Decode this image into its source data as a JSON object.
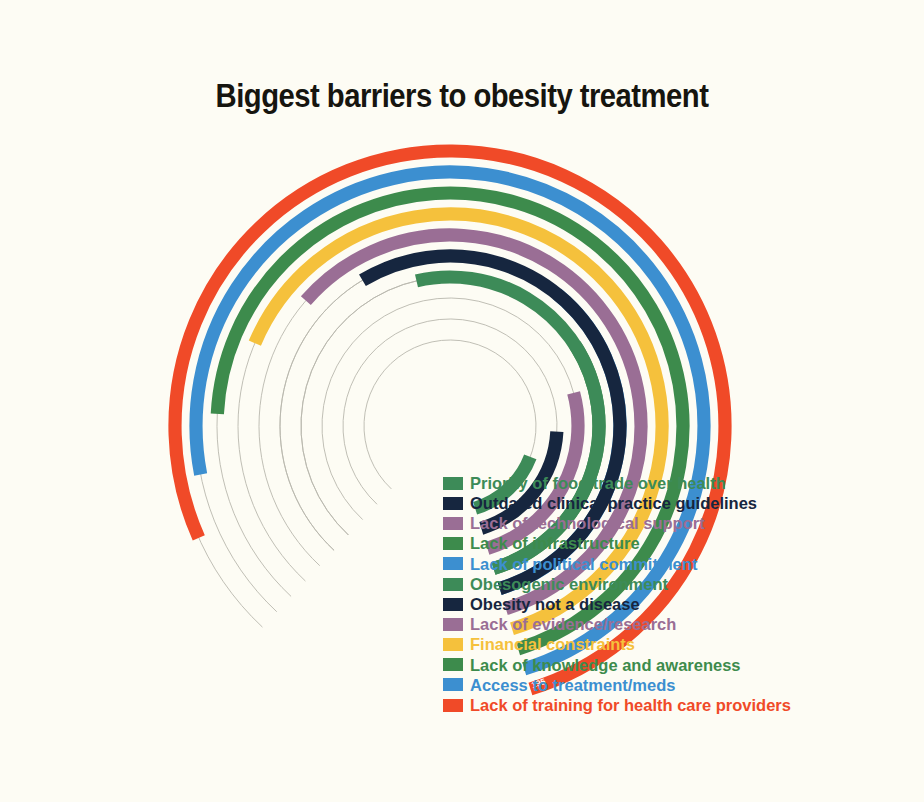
{
  "title": "Biggest barriers to obesity treatment",
  "background_color": "#fdfcf4",
  "axis_end_label": "195",
  "legend": {
    "items": [
      {
        "label": "Priority of food trade over health",
        "color": "#3d8b58"
      },
      {
        "label": "Outdated clinical practice guidelines",
        "color": "#16263f"
      },
      {
        "label": "Lack of technological support",
        "color": "#9a6e95"
      },
      {
        "label": "Lack of infrastructure",
        "color": "#3d8b4c"
      },
      {
        "label": "Lack of political commitment",
        "color": "#3c8fd0"
      },
      {
        "label": "Obesogenic environment",
        "color": "#3d8b58"
      },
      {
        "label": "Obesity not a disease",
        "color": "#16263f"
      },
      {
        "label": "Lack of evidence/research",
        "color": "#9a6e95"
      },
      {
        "label": "Financial constraints",
        "color": "#f5c13c"
      },
      {
        "label": "Lack of knowledge and awareness",
        "color": "#3d8b4c"
      },
      {
        "label": "Access to treatment/meds",
        "color": "#3c8fd0"
      },
      {
        "label": "Lack of training for health care providers",
        "color": "#f04a28"
      }
    ]
  },
  "chart_data": {
    "type": "bar",
    "subtype": "radial-bar",
    "title": "Biggest barriers to obesity treatment",
    "xlabel": "",
    "ylabel": "",
    "grid": true,
    "legend_position": "inside-right",
    "value_axis_max": 195,
    "value_axis_end_tick": "195",
    "note": "Polar/radial bar chart. Bars share a common start angle on the lower-right and sweep counter-clockwise; ring index 1 = innermost (shortest), ring index 12 = outermost (longest).",
    "categories": [
      "Priority of food trade over health",
      "Outdated clinical practice guidelines",
      "Lack of technological support",
      "Lack of infrastructure",
      "Lack of political commitment",
      "Obesogenic environment",
      "Obesity not a disease",
      "Lack of evidence/research",
      "Financial constraints",
      "Lack of knowledge and awareness",
      "Access to treatment/meds",
      "Lack of training for health care providers"
    ],
    "values": [
      28,
      38,
      48,
      58,
      68,
      96,
      106,
      116,
      126,
      150,
      182,
      195
    ],
    "colors": [
      "#3d8b58",
      "#16263f",
      "#9a6e95",
      "#3d8b4c",
      "#3c8fd0",
      "#3d8b58",
      "#16263f",
      "#9a6e95",
      "#f5c13c",
      "#3d8b4c",
      "#3c8fd0",
      "#f04a28"
    ],
    "series": [
      {
        "name": "Biggest barriers to obesity treatment",
        "values": [
          28,
          38,
          48,
          58,
          68,
          96,
          106,
          116,
          126,
          150,
          182,
          195
        ]
      }
    ],
    "geometry": {
      "center_x": 450,
      "center_y": 426,
      "start_angle_deg": 73,
      "inner_radius": 52,
      "ring_step": 21.3,
      "bar_thickness": 13.2,
      "rings": [
        {
          "index": 1,
          "radius": 86,
          "sweep_deg": 52
        },
        {
          "index": 2,
          "radius": 107,
          "sweep_deg": 70
        },
        {
          "index": 3,
          "radius": 128,
          "sweep_deg": 88
        },
        {
          "index": 4,
          "radius": 149,
          "sweep_deg": 106
        },
        {
          "index": 5,
          "radius": 170,
          "sweep_deg": 124
        },
        {
          "index": 6,
          "radius": 149,
          "sweep_deg": 176
        },
        {
          "index": 7,
          "radius": 170,
          "sweep_deg": 194
        },
        {
          "index": 8,
          "radius": 191,
          "sweep_deg": 212
        },
        {
          "index": 9,
          "radius": 212,
          "sweep_deg": 230
        },
        {
          "index": 10,
          "radius": 233,
          "sweep_deg": 250
        },
        {
          "index": 11,
          "radius": 254,
          "sweep_deg": 264
        },
        {
          "index": 12,
          "radius": 275,
          "sweep_deg": 277
        }
      ]
    }
  }
}
